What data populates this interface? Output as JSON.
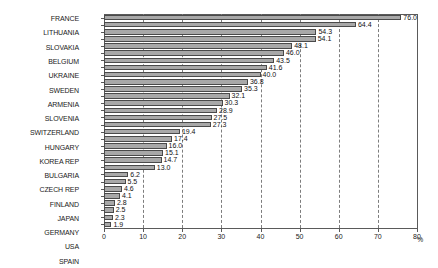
{
  "chart_data": {
    "type": "bar",
    "orientation": "horizontal",
    "title": "",
    "xlabel": "%",
    "ylabel": "",
    "xlim": [
      0,
      80
    ],
    "xticks": [
      0,
      10,
      20,
      30,
      40,
      50,
      60,
      70,
      80
    ],
    "grid": true,
    "legend": "none",
    "categories": [
      "FRANCE",
      "LITHUANIA",
      "SLOVAKIA",
      "BELGIUM",
      "UKRAINE",
      "SWEDEN",
      "ARMENIA",
      "SLOVENIA",
      "SWITZERLAND",
      "HUNGARY",
      "KOREA REP",
      "BULGARIA",
      "CZECH REP",
      "FINLAND",
      "JAPAN",
      "GERMANY",
      "USA",
      "SPAIN",
      "RUSSIA",
      "UK",
      "CANADA",
      "ROMANIA",
      "ARGENTINA",
      "SOUTH AFRICA",
      "MEXICO",
      "NETHERLANDS",
      "BRAZIL",
      "INDIA",
      "PAKISTAN",
      "CHINA"
    ],
    "values": [
      76.0,
      64.4,
      54.3,
      54.1,
      48.1,
      46.0,
      43.5,
      41.6,
      40.0,
      36.8,
      35.3,
      32.1,
      30.3,
      28.9,
      27.5,
      27.3,
      19.4,
      17.4,
      16.0,
      15.1,
      14.7,
      13.0,
      6.2,
      5.5,
      4.6,
      4.1,
      2.8,
      2.5,
      2.3,
      1.9
    ],
    "value_labels": [
      "76.0",
      "64.4",
      "54.3",
      "54.1",
      "48.1",
      "46.0",
      "43.5",
      "41.6",
      "40.0",
      "36.8",
      "35.3",
      "32.1",
      "30.3",
      "28.9",
      "27.5",
      "27.3",
      "19.4",
      "17.4",
      "16.0",
      "15.1",
      "14.7",
      "13.0",
      "6.2",
      "5.5",
      "4.6",
      "4.1",
      "2.8",
      "2.5",
      "2.3",
      "1.9"
    ],
    "bar_color": "#a8a8a8",
    "bar_edge_color": "#4a4a4a",
    "grid_color": "#7d7d7d",
    "axis_color": "#5a5a5a"
  }
}
